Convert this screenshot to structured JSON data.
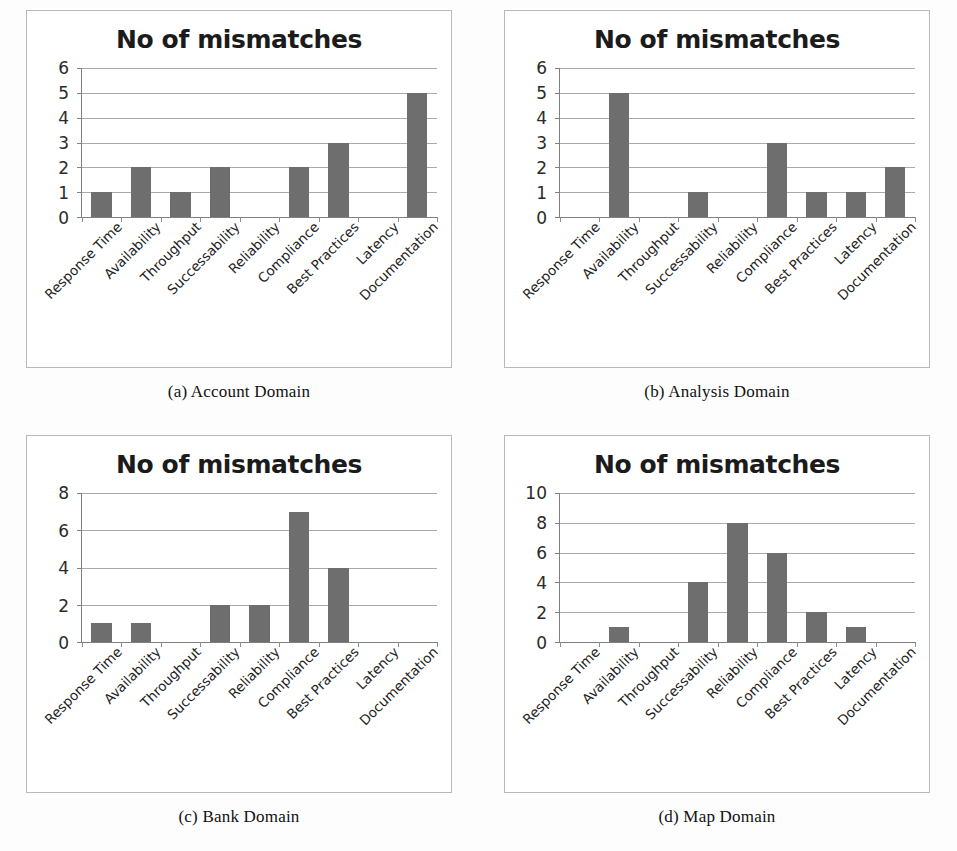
{
  "figure": {
    "panels": [
      {
        "caption": "(a)  Account Domain",
        "chart_data": {
          "type": "bar",
          "title": "No of mismatches",
          "xlabel": "",
          "ylabel": "",
          "categories": [
            "Response Time",
            "Availability",
            "Throughput",
            "Successability",
            "Reliability",
            "Compliance",
            "Best Practices",
            "Latency",
            "Documentation"
          ],
          "values": [
            1,
            2,
            1,
            2,
            0,
            2,
            3,
            0,
            5
          ],
          "yticks": [
            0,
            1,
            2,
            3,
            4,
            5,
            6
          ],
          "ylim": [
            0,
            6
          ],
          "grid": true,
          "legend": "none"
        }
      },
      {
        "caption": "(b)  Analysis Domain",
        "chart_data": {
          "type": "bar",
          "title": "No of mismatches",
          "xlabel": "",
          "ylabel": "",
          "categories": [
            "Response Time",
            "Availability",
            "Throughput",
            "Successability",
            "Reliability",
            "Compliance",
            "Best Practices",
            "Latency",
            "Documentation"
          ],
          "values": [
            0,
            5,
            0,
            1,
            0,
            3,
            1,
            1,
            2
          ],
          "yticks": [
            0,
            1,
            2,
            3,
            4,
            5,
            6
          ],
          "ylim": [
            0,
            6
          ],
          "grid": true,
          "legend": "none"
        }
      },
      {
        "caption": "(c)  Bank Domain",
        "chart_data": {
          "type": "bar",
          "title": "No of mismatches",
          "xlabel": "",
          "ylabel": "",
          "categories": [
            "Response Time",
            "Availability",
            "Throughput",
            "Successability",
            "Reliability",
            "Compliance",
            "Best Practices",
            "Latency",
            "Documentation"
          ],
          "values": [
            1,
            1,
            0,
            2,
            2,
            7,
            4,
            0,
            0
          ],
          "yticks": [
            0,
            2,
            4,
            6,
            8
          ],
          "ylim": [
            0,
            8
          ],
          "grid": true,
          "legend": "none"
        }
      },
      {
        "caption": "(d)  Map Domain",
        "chart_data": {
          "type": "bar",
          "title": "No of mismatches",
          "xlabel": "",
          "ylabel": "",
          "categories": [
            "Response Time",
            "Availability",
            "Throughput",
            "Successability",
            "Reliability",
            "Compliance",
            "Best Practices",
            "Latency",
            "Documentation"
          ],
          "values": [
            0,
            1,
            0,
            4,
            8,
            6,
            2,
            1,
            0
          ],
          "yticks": [
            0,
            2,
            4,
            6,
            8,
            10
          ],
          "ylim": [
            0,
            10
          ],
          "grid": true,
          "legend": "none"
        }
      }
    ]
  },
  "colors": {
    "bar": "#6e6e6e",
    "grid": "#8d8d8d",
    "axis": "#808080",
    "panel_border": "#b9b9b9",
    "title_text": "#1b1b1b",
    "background": "#fdfdfd"
  }
}
